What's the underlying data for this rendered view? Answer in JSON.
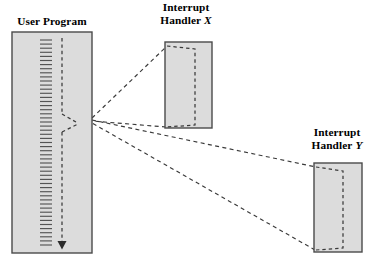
{
  "diagram": {
    "type": "interrupt-handling-control-flow",
    "background_color": "#ffffff",
    "box_fill_color": "#dcdcdc",
    "box_border_color": "#4a4a4a",
    "line_color": "#3a3a3a",
    "labels": {
      "user_program": "User Program",
      "handler_x_line1": "Interrupt",
      "handler_x_line2": "Handler",
      "handler_x_var": "X",
      "handler_y_line1": "Interrupt",
      "handler_y_line2": "Handler",
      "handler_y_var": "Y"
    },
    "boxes": [
      {
        "name": "user-program",
        "x": 12,
        "y": 32,
        "width": 80,
        "height": 221
      },
      {
        "name": "interrupt-handler-x",
        "x": 165,
        "y": 42,
        "width": 47,
        "height": 86
      },
      {
        "name": "interrupt-handler-y",
        "x": 314,
        "y": 163,
        "width": 48,
        "height": 89
      }
    ],
    "user_program_flow": {
      "hatch_column_x": 46,
      "hatch_top": 40,
      "hatch_bottom": 247,
      "hatch_half_width": 6,
      "hatch_spacing": 4.1,
      "dashed_line_x": 62,
      "dashed_top": 38,
      "arrow_tip_y": 249
    },
    "interrupt_points": {
      "convergence_x": 92,
      "convergence_y": 119
    }
  }
}
